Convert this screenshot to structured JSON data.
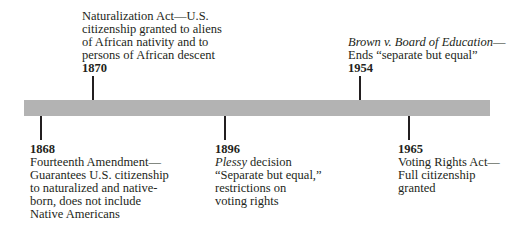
{
  "timeline": {
    "bar_color": "#b3b3b3",
    "events": [
      {
        "year": "1868",
        "position": "below",
        "lines": [
          "Fourteenth Amendment—",
          "Guarantees U.S. citizenship",
          "to naturalized and native-",
          "born, does not include",
          "Native Americans"
        ]
      },
      {
        "year": "1870",
        "position": "above",
        "lines": [
          "Naturalization Act—U.S.",
          "citizenship granted to aliens",
          "of African nativity and to",
          "persons of African descent"
        ]
      },
      {
        "year": "1896",
        "position": "below",
        "italic_prefix": "Plessy",
        "first_line_rest": " decision",
        "lines": [
          "“Separate but equal,”",
          "restrictions on",
          "voting rights"
        ]
      },
      {
        "year": "1954",
        "position": "above",
        "italic_prefix": "Brown v. Board of Education",
        "first_line_rest": "—",
        "lines": [
          "Ends “separate but equal”"
        ]
      },
      {
        "year": "1965",
        "position": "below",
        "lines": [
          "Voting Rights Act—",
          "Full citizenship",
          "granted"
        ]
      }
    ]
  }
}
